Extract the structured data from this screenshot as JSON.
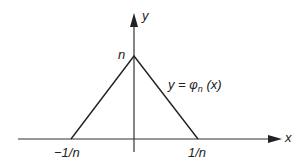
{
  "diagram": {
    "type": "function-graph",
    "axes": {
      "x_label": "x",
      "y_label": "y"
    },
    "peak_label": "n",
    "curve_label": {
      "prefix": "y = φ",
      "subscript": "n",
      "suffix": " (x)"
    },
    "ticks": {
      "left": "−1/n",
      "right": "1/n"
    },
    "shape": {
      "description": "triangle function: 0 outside [-1/n, 1/n], peak value n at x=0",
      "points": [
        [
          -1,
          0
        ],
        [
          0,
          1
        ],
        [
          1,
          0
        ]
      ]
    },
    "colors": {
      "line": "#222222",
      "axis": "#333333",
      "background": "#ffffff"
    }
  }
}
